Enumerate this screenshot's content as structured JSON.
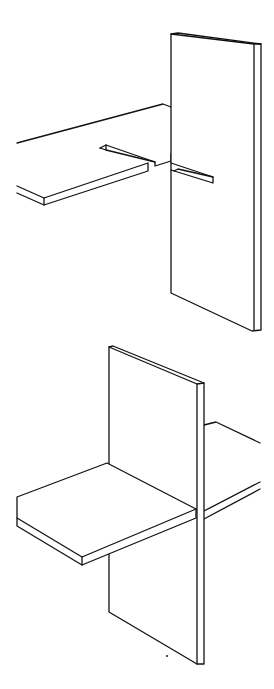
{
  "figures": [
    {
      "id": "top",
      "description": "Slotted horizontal board approaching vertical slotted board (exploded view)"
    },
    {
      "id": "bottom",
      "description": "Boards interlocked in cross-halving joint (assembled view)"
    }
  ],
  "colors": {
    "line": "#111111",
    "background": "#ffffff"
  }
}
